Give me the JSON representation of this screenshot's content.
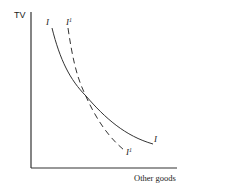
{
  "diagram": {
    "type": "indifference-curves",
    "y_axis_label": "TV",
    "x_axis_label": "Other goods",
    "curves": [
      {
        "name": "I",
        "style": "solid",
        "label_top": "I",
        "label_bottom": "I"
      },
      {
        "name": "I1",
        "style": "dashed",
        "label_top": "I",
        "label_top_sup": "1",
        "label_bottom": "I",
        "label_bottom_sup": "1"
      }
    ]
  }
}
